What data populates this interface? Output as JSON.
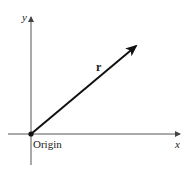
{
  "diagram": {
    "type": "vector-in-2d-coordinate-plane",
    "axes": {
      "x_label": "x",
      "y_label": "y"
    },
    "origin_label": "Origin",
    "vector": {
      "label": "r⃗",
      "from": "origin",
      "direction": "up-right"
    },
    "colors": {
      "axis": "#555555",
      "vector": "#111111",
      "text": "#222222",
      "background": "#ffffff"
    }
  }
}
